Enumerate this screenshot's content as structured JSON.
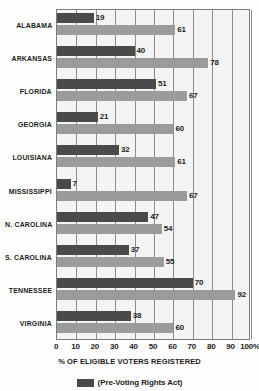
{
  "chart_data": {
    "type": "bar",
    "orientation": "horizontal",
    "title": "",
    "xlabel": "% OF ELIGIBLE VOTERS REGISTERED",
    "ylabel": "",
    "xlim": [
      0,
      100
    ],
    "grid": true,
    "legend_position": "bottom",
    "categories": [
      "ALABAMA",
      "ARKANSAS",
      "FLORIDA",
      "GEORGIA",
      "LOUISIANA",
      "MISSISSIPPI",
      "N. CAROLINA",
      "S. CAROLINA",
      "TENNESSEE",
      "VIRGINIA"
    ],
    "series": [
      {
        "name": "(Pre-Voting Rights Act)",
        "color": "#4a4a4a",
        "values": [
          19,
          40,
          51,
          21,
          32,
          7,
          47,
          37,
          70,
          38
        ]
      },
      {
        "name": "",
        "color": "#9b9b9b",
        "values": [
          61,
          78,
          67,
          60,
          61,
          67,
          54,
          55,
          92,
          60
        ]
      }
    ],
    "xticks": [
      {
        "value": 0,
        "label": "0"
      },
      {
        "value": 10,
        "label": "10"
      },
      {
        "value": 20,
        "label": "20"
      },
      {
        "value": 30,
        "label": "30"
      },
      {
        "value": 40,
        "label": "40"
      },
      {
        "value": 50,
        "label": "50"
      },
      {
        "value": 60,
        "label": "60"
      },
      {
        "value": 70,
        "label": "70"
      },
      {
        "value": 80,
        "label": "80"
      },
      {
        "value": 90,
        "label": "90"
      },
      {
        "value": 100,
        "label": "100%"
      }
    ]
  },
  "legend": {
    "entries": [
      {
        "label": "(Pre-Voting Rights Act)",
        "color": "#4a4a4a"
      }
    ]
  },
  "colors": {
    "series_dark": "#4a4a4a",
    "series_light": "#9b9b9b",
    "plot_background": "#f4f4f4",
    "gridline": "#8c8c8c",
    "text": "#1c1c1c"
  }
}
